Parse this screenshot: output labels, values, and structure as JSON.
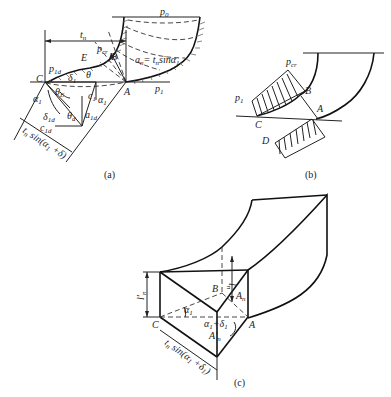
{
  "figure": {
    "panels": [
      {
        "id": "a",
        "caption": "(a)",
        "labels": {
          "p0": "p",
          "p0_sub": "0",
          "p1": "p",
          "p1_sub": "1",
          "p1d": "p",
          "p1d_sub": "1d",
          "pcr": "p",
          "pcr_sub": "cr",
          "tn": "t",
          "tn_sub": "n",
          "an": "a",
          "an_sub": "n",
          "an_eq": "= t",
          "an_eq_sub": "n",
          "an_sin": "sinα",
          "an_sin_sub": "1",
          "C": "C",
          "A": "A",
          "B": "B",
          "E": "E",
          "theta": "θ",
          "delta1": "δ",
          "delta1_sub": "1",
          "thetaE": "θ",
          "thetaE_sub": "E",
          "alpha1": "α",
          "alpha1_sub": "1",
          "alpha1b": "α",
          "alpha1b_sub": "1",
          "c1": "c",
          "c1_sub": "1",
          "delta1d": "δ",
          "delta1d_sub": "1d",
          "thetad": "θ",
          "thetad_sub": "d",
          "a1d": "a",
          "a1d_sub": "1d",
          "c1d": "c",
          "c1d_sub": "1d",
          "width_label": "t",
          "width_label_sub": "n",
          "width_label_rest": " sin(α",
          "width_label_rest_sub": "1",
          "width_label_end": " +δ)"
        }
      },
      {
        "id": "b",
        "caption": "(b)",
        "labels": {
          "p1": "p",
          "p1_sub": "1",
          "pcr": "p",
          "pcr_sub": "cr",
          "B": "B",
          "A": "A",
          "C": "C",
          "D": "D"
        }
      },
      {
        "id": "c",
        "caption": "(c)",
        "labels": {
          "ln": "l",
          "ln_sub": "n",
          "ln_prime": "l′",
          "ln_prime_sub": "n",
          "B": "B",
          "C": "C",
          "A": "A",
          "An": "A",
          "An_sub": "n",
          "An_prime": "A′",
          "An_prime_sub": "n",
          "alpha1": "α",
          "alpha1_sub": "1",
          "alpha_delta": "α",
          "alpha_delta_sub": "1",
          "alpha_delta_plus": "+δ",
          "alpha_delta_plus_sub": "1",
          "width_label": "t",
          "width_label_sub": "n",
          "width_label_rest": " sin(α",
          "width_label_rest_sub": "1",
          "width_label_end": " +δ",
          "width_label_end_sub": "1",
          "width_label_close": ")"
        }
      }
    ]
  }
}
